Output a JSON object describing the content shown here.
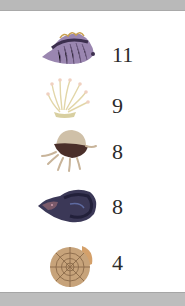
{
  "items": [
    {
      "name": "striped shell",
      "icon": "striped-shell-icon",
      "count": "11",
      "color": "#8a6fa0"
    },
    {
      "name": "sea anemone",
      "icon": "sea-anemone-icon",
      "count": "9",
      "color": "#e8e0c0"
    },
    {
      "name": "jellyfish shell",
      "icon": "jellyfish-icon",
      "count": "8",
      "color": "#b39a7a"
    },
    {
      "name": "conch shell",
      "icon": "conch-shell-icon",
      "count": "8",
      "color": "#3d3a5a"
    },
    {
      "name": "ammonite",
      "icon": "ammonite-icon",
      "count": "4",
      "color": "#c49a6c"
    }
  ]
}
